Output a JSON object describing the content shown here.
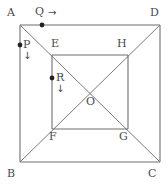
{
  "figure": {
    "stroke_color": "#6e6e6e",
    "label_color": "#4a4a4a",
    "point_color": "#222222",
    "background_color": "#ffffff",
    "outer_square": {
      "name": "ABCD",
      "vertices": [
        {
          "label": "A",
          "x": 20,
          "y": 25,
          "label_x": 7,
          "label_y": 7
        },
        {
          "label": "D",
          "x": 160,
          "y": 25,
          "label_x": 150,
          "label_y": 7
        },
        {
          "label": "C",
          "x": 160,
          "y": 162,
          "label_x": 148,
          "label_y": 168
        },
        {
          "label": "B",
          "x": 20,
          "y": 162,
          "label_x": 7,
          "label_y": 168
        }
      ]
    },
    "inner_square": {
      "name": "EFGH",
      "vertices": [
        {
          "label": "E",
          "x": 52,
          "y": 55,
          "label_x": 51,
          "label_y": 38
        },
        {
          "label": "H",
          "x": 128,
          "y": 55,
          "label_x": 117,
          "label_y": 38
        },
        {
          "label": "G",
          "x": 128,
          "y": 129,
          "label_x": 119,
          "label_y": 131
        },
        {
          "label": "F",
          "x": 52,
          "y": 129,
          "label_x": 49,
          "label_y": 131
        }
      ]
    },
    "center": {
      "label": "O",
      "x": 90,
      "y": 92,
      "label_x": 86,
      "label_y": 96
    },
    "diagonals": [
      {
        "from": "A",
        "to": "C",
        "x1": 20,
        "y1": 25,
        "x2": 160,
        "y2": 162
      },
      {
        "from": "B",
        "to": "D",
        "x1": 20,
        "y1": 162,
        "x2": 160,
        "y2": 25
      }
    ],
    "moving_points": [
      {
        "label": "Q",
        "x": 42,
        "y": 25,
        "label_x": 35,
        "label_y": 6,
        "arrow": "→",
        "arrow_x": 48,
        "arrow_y": 8,
        "on_segment": "AD",
        "direction": "right"
      },
      {
        "label": "P",
        "x": 20,
        "y": 45,
        "label_x": 23,
        "label_y": 39,
        "arrow": "↓",
        "arrow_x": 23,
        "arrow_y": 51,
        "on_segment": "AB",
        "direction": "down"
      },
      {
        "label": "R",
        "x": 52,
        "y": 78,
        "label_x": 56,
        "label_y": 72,
        "arrow": "↓",
        "arrow_x": 56,
        "arrow_y": 84,
        "on_segment": "EF",
        "direction": "down"
      }
    ]
  }
}
